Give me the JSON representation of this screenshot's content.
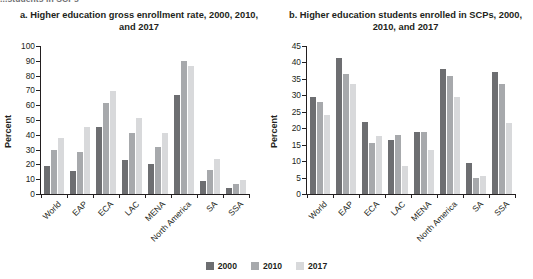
{
  "header": {
    "running_text": "...students in SCPs"
  },
  "legend": {
    "position": "bottom-center",
    "entries": [
      {
        "label": "2000",
        "color": "#6d6e71"
      },
      {
        "label": "2010",
        "color": "#a7a9ac"
      },
      {
        "label": "2017",
        "color": "#d8d9db"
      }
    ]
  },
  "panels": [
    {
      "id": "panel-a",
      "title": "a. Higher education gross enrollment rate, 2000, 2010, and 2017"
    },
    {
      "id": "panel-b",
      "title": "b. Higher education students enrolled in SCPs, 2000, 2010, and 2017"
    }
  ],
  "chart_data": [
    {
      "type": "bar",
      "title": "a. Higher education gross enrollment rate, 2000, 2010, and 2017",
      "xlabel": "",
      "ylabel": "Percent",
      "ylim": [
        0,
        100
      ],
      "yticks": [
        0,
        10,
        20,
        30,
        40,
        50,
        60,
        70,
        80,
        90,
        100
      ],
      "grid": false,
      "legend_position": "bottom-center",
      "categories": [
        "World",
        "EAP",
        "ECA",
        "LAC",
        "MENA",
        "North America",
        "SA",
        "SSA"
      ],
      "series": [
        {
          "name": "2000",
          "color": "#6d6e71",
          "values": [
            19,
            15.5,
            45,
            23,
            20.5,
            67,
            8.5,
            4
          ]
        },
        {
          "name": "2010",
          "color": "#a7a9ac",
          "values": [
            29.5,
            28.5,
            61.5,
            41.5,
            31.5,
            90,
            16,
            7
          ]
        },
        {
          "name": "2017",
          "color": "#d8d9db",
          "values": [
            38,
            45.5,
            69.5,
            51.5,
            41.5,
            86.5,
            23.5,
            9.5
          ]
        }
      ]
    },
    {
      "type": "bar",
      "title": "b. Higher education students enrolled in SCPs, 2000, 2010, and 2017",
      "xlabel": "",
      "ylabel": "Percent",
      "ylim": [
        0,
        45
      ],
      "yticks": [
        0,
        5,
        10,
        15,
        20,
        25,
        30,
        35,
        40,
        45
      ],
      "grid": false,
      "legend_position": "bottom-center",
      "categories": [
        "World",
        "EAP",
        "ECA",
        "LAC",
        "MENA",
        "North America",
        "SA",
        "SSA"
      ],
      "series": [
        {
          "name": "2000",
          "color": "#6d6e71",
          "values": [
            29.5,
            41.5,
            22,
            16.5,
            19,
            38,
            9.5,
            37
          ]
        },
        {
          "name": "2010",
          "color": "#a7a9ac",
          "values": [
            28,
            36.5,
            15.5,
            18,
            19,
            36,
            5,
            33.5
          ]
        },
        {
          "name": "2017",
          "color": "#d8d9db",
          "values": [
            24,
            33.5,
            17.5,
            8.5,
            13.5,
            29.5,
            5.5,
            21.5
          ]
        }
      ]
    }
  ]
}
